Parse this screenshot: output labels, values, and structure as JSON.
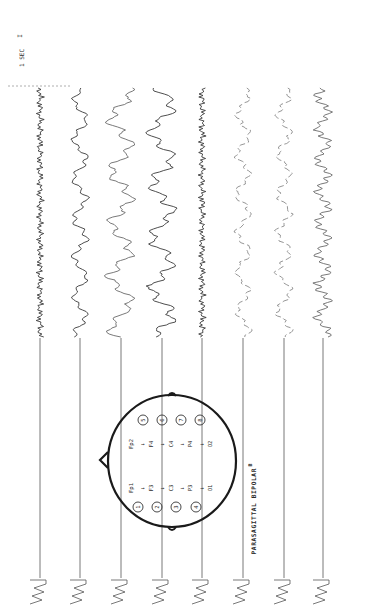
{
  "figure": {
    "montage_title": "PARASAGITTAL BIPOLAR",
    "panel_letter": "B",
    "time_marker_label": "1 SEC",
    "time_marker_tick": "I"
  },
  "head_diagram": {
    "left_chain": [
      "Fp1",
      "F3",
      "C3",
      "P3",
      "O1"
    ],
    "right_chain": [
      "Fp2",
      "F4",
      "C4",
      "P4",
      "O2"
    ],
    "left_channel_numbers": [
      "1",
      "2",
      "3",
      "4"
    ],
    "right_channel_numbers": [
      "5",
      "6",
      "7",
      "8"
    ],
    "arrow": "→"
  },
  "channels": [
    {
      "number": "1",
      "derivation": "Fp1-F3",
      "style": "dark",
      "activity": "low-amplitude fast"
    },
    {
      "number": "2",
      "derivation": "F3-C3",
      "style": "dark",
      "activity": "moderate slow"
    },
    {
      "number": "3",
      "derivation": "C3-P3",
      "style": "light",
      "activity": "high-amplitude slow"
    },
    {
      "number": "4",
      "derivation": "P3-O1",
      "style": "dark",
      "activity": "high-amplitude slow"
    },
    {
      "number": "5",
      "derivation": "Fp2-F4",
      "style": "dark",
      "activity": "low-amplitude fast"
    },
    {
      "number": "6",
      "derivation": "F4-C4",
      "style": "faint",
      "activity": "moderate slow"
    },
    {
      "number": "7",
      "derivation": "C4-P4",
      "style": "faint",
      "activity": "moderate slow"
    },
    {
      "number": "8",
      "derivation": "P4-O2",
      "style": "light",
      "activity": "moderate mixed"
    }
  ]
}
